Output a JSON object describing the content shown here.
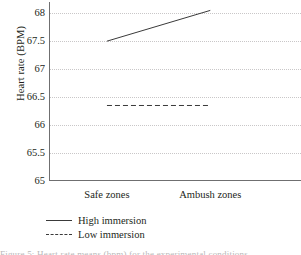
{
  "chart_data": {
    "type": "line",
    "title": "",
    "xlabel": "",
    "ylabel": "Heart rate (BPM)",
    "categories": [
      "Safe zones",
      "Ambush zones"
    ],
    "ylim": [
      65,
      68.2
    ],
    "yticks": [
      65,
      65.5,
      66,
      66.5,
      67,
      67.5,
      68
    ],
    "ytick_labels": [
      "65",
      "65.5",
      "66",
      "66.5",
      "67",
      "67.5",
      "68"
    ],
    "grid": true,
    "legend_position": "below-axes-left",
    "series": [
      {
        "name": "High immersion",
        "style": "solid",
        "color": "#3a3a3a",
        "values": [
          67.5,
          68.05
        ]
      },
      {
        "name": "Low immersion",
        "style": "dashed",
        "color": "#3a3a3a",
        "values": [
          66.35,
          66.35
        ]
      }
    ]
  },
  "axis": {
    "y_title": "Heart rate (BPM)"
  },
  "legend": {
    "entries": [
      {
        "label": "High immersion",
        "style": "solid"
      },
      {
        "label": "Low immersion",
        "style": "dashed"
      }
    ]
  },
  "caption": {
    "sliver_text": "Figure 5: Heart rate means (bpm) for the experimental conditions."
  }
}
